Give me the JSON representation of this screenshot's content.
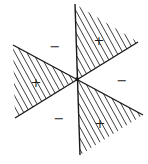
{
  "diagram": {
    "regions": [
      {
        "id": "top",
        "sign": "+",
        "shaded": true
      },
      {
        "id": "upper-left",
        "sign": "−",
        "shaded": false
      },
      {
        "id": "left",
        "sign": "+",
        "shaded": true
      },
      {
        "id": "lower-left",
        "sign": "−",
        "shaded": false
      },
      {
        "id": "bottom",
        "sign": "+",
        "shaded": true
      },
      {
        "id": "right",
        "sign": "−",
        "shaded": false
      }
    ],
    "colors": {
      "ink": "#1a1a1a",
      "background": "#ffffff"
    }
  }
}
